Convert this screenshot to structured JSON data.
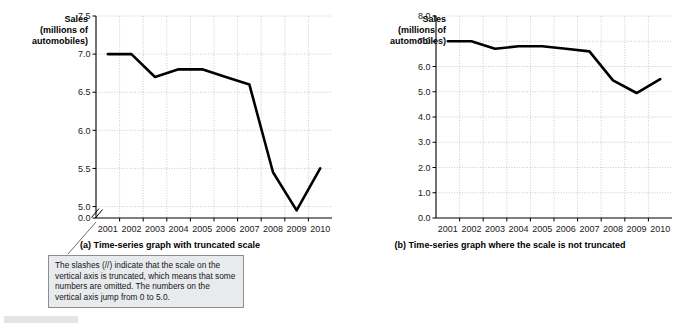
{
  "figure": {
    "panel_a": {
      "axis_title_line1": "Sales",
      "axis_title_line2": "(millions of",
      "axis_title_line3": "automobiles)",
      "caption": "(a) Time-series graph with truncated scale"
    },
    "panel_b": {
      "axis_title_line1": "Sales",
      "axis_title_line2": "(millions of",
      "axis_title_line3": "automobiles)",
      "caption": "(b) Time-series graph where the scale is not truncated"
    },
    "callout": {
      "text": "The slashes (//) indicate that the scale on the vertical axis is truncated, which means that some numbers are omitted.  The numbers on the vertical axis jump from 0 to 5.0."
    }
  },
  "chart_data": [
    {
      "id": "panel-a",
      "type": "line",
      "title": "(a) Time-series graph with truncated scale",
      "xlabel": "",
      "ylabel": "Sales (millions of automobiles)",
      "x": [
        "2001",
        "2002",
        "2003",
        "2004",
        "2005",
        "2006",
        "2007",
        "2008",
        "2009",
        "2010"
      ],
      "categories": [
        "2001",
        "2002",
        "2003",
        "2004",
        "2005",
        "2006",
        "2007",
        "2008",
        "2009",
        "2010"
      ],
      "values": [
        7.0,
        7.0,
        6.7,
        6.8,
        6.8,
        6.7,
        6.6,
        5.45,
        4.95,
        5.5
      ],
      "series": [
        {
          "name": "Sales",
          "values": [
            7.0,
            7.0,
            6.7,
            6.8,
            6.8,
            6.7,
            6.6,
            5.45,
            4.95,
            5.5
          ]
        }
      ],
      "ylim": [
        4.85,
        7.5
      ],
      "yticks": [
        "0.0",
        "5.0",
        "5.5",
        "6.0",
        "6.5",
        "7.0",
        "7.5"
      ],
      "ytick_values": [
        4.85,
        5.0,
        5.5,
        6.0,
        6.5,
        7.0,
        7.5
      ],
      "xticks": [
        "2001",
        "2002",
        "2003",
        "2004",
        "2005",
        "2006",
        "2007",
        "2008",
        "2009",
        "2010"
      ],
      "truncated_axis": true,
      "truncation_marker": "//",
      "grid": true,
      "legend": "none",
      "line_color": "#000000",
      "grid_color": "#b9bcc0"
    },
    {
      "id": "panel-b",
      "type": "line",
      "title": "(b) Time-series graph where the scale is not truncated",
      "xlabel": "",
      "ylabel": "Sales (millions of automobiles)",
      "x": [
        "2001",
        "2002",
        "2003",
        "2004",
        "2005",
        "2006",
        "2007",
        "2008",
        "2009",
        "2010"
      ],
      "categories": [
        "2001",
        "2002",
        "2003",
        "2004",
        "2005",
        "2006",
        "2007",
        "2008",
        "2009",
        "2010"
      ],
      "values": [
        7.0,
        7.0,
        6.7,
        6.8,
        6.8,
        6.7,
        6.6,
        5.45,
        4.95,
        5.5
      ],
      "series": [
        {
          "name": "Sales",
          "values": [
            7.0,
            7.0,
            6.7,
            6.8,
            6.8,
            6.7,
            6.6,
            5.45,
            4.95,
            5.5
          ]
        }
      ],
      "ylim": [
        0.0,
        8.0
      ],
      "yticks": [
        "0.0",
        "1.0",
        "2.0",
        "3.0",
        "4.0",
        "5.0",
        "6.0",
        "7.0",
        "8.0"
      ],
      "ytick_values": [
        0.0,
        1.0,
        2.0,
        3.0,
        4.0,
        5.0,
        6.0,
        7.0,
        8.0
      ],
      "xticks": [
        "2001",
        "2002",
        "2003",
        "2004",
        "2005",
        "2006",
        "2007",
        "2008",
        "2009",
        "2010"
      ],
      "truncated_axis": false,
      "grid": true,
      "legend": "none",
      "line_color": "#000000",
      "grid_color": "#b9bcc0"
    }
  ]
}
